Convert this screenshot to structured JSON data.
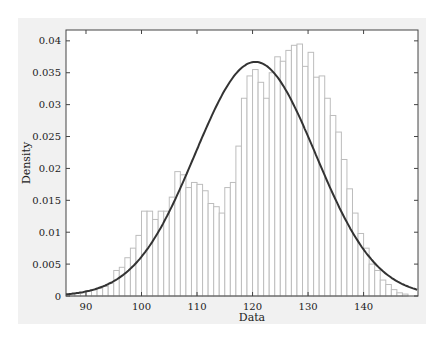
{
  "chart_data": {
    "type": "bar",
    "title": "",
    "xlabel": "Data",
    "ylabel": "Density",
    "xlim": [
      86.4,
      149.8
    ],
    "ylim": [
      0,
      0.042
    ],
    "xticks": [
      90,
      100,
      110,
      120,
      130,
      140
    ],
    "yticks": [
      0,
      0.005,
      0.01,
      0.015,
      0.02,
      0.025,
      0.03,
      0.035,
      0.04
    ],
    "ytick_labels": [
      "0",
      "0.005",
      "0.01",
      "0.015",
      "0.02",
      "0.025",
      "0.03",
      "0.035",
      "0.04"
    ],
    "grid": false,
    "legend": null,
    "histogram": {
      "bin_width": 1,
      "bin_starts": [
        87,
        88,
        89,
        90,
        91,
        92,
        93,
        94,
        95,
        96,
        97,
        98,
        99,
        100,
        101,
        102,
        103,
        104,
        105,
        106,
        107,
        108,
        109,
        110,
        111,
        112,
        113,
        114,
        115,
        116,
        117,
        118,
        119,
        120,
        121,
        122,
        123,
        124,
        125,
        126,
        127,
        128,
        129,
        130,
        131,
        132,
        133,
        134,
        135,
        136,
        137,
        138,
        139,
        140,
        141,
        142,
        143,
        144,
        145,
        146,
        147
      ],
      "density": [
        0.0003,
        0.0005,
        0.0005,
        0.0008,
        0.001,
        0.0012,
        0.0015,
        0.002,
        0.004,
        0.0045,
        0.006,
        0.0075,
        0.0095,
        0.0133,
        0.0133,
        0.012,
        0.0133,
        0.0133,
        0.0155,
        0.0195,
        0.019,
        0.017,
        0.0178,
        0.0175,
        0.0165,
        0.0145,
        0.014,
        0.013,
        0.017,
        0.0178,
        0.0235,
        0.031,
        0.0345,
        0.0355,
        0.0335,
        0.031,
        0.035,
        0.0375,
        0.0368,
        0.0385,
        0.0393,
        0.0395,
        0.036,
        0.0382,
        0.0343,
        0.0345,
        0.031,
        0.0283,
        0.0257,
        0.0214,
        0.0168,
        0.013,
        0.0098,
        0.0075,
        0.005,
        0.004,
        0.0025,
        0.0018,
        0.001,
        0.0005,
        0.0003
      ],
      "color": "#bdbdbd"
    },
    "fitted_curve": {
      "type": "normal_pdf",
      "mean": 120.5,
      "std": 10.85,
      "peak_density": 0.0367,
      "color": "#333333"
    }
  }
}
